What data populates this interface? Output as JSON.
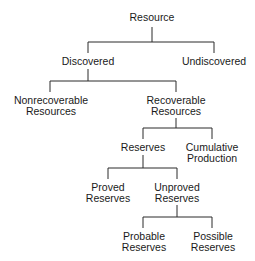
{
  "diagram": {
    "type": "tree",
    "line_color": "#2a2a2a",
    "nodes": {
      "resource": {
        "lines": [
          "Resource"
        ]
      },
      "discovered": {
        "lines": [
          "Discovered"
        ]
      },
      "undiscovered": {
        "lines": [
          "Undiscovered"
        ]
      },
      "nonrecoverable": {
        "lines": [
          "Nonrecoverable",
          "Resources"
        ]
      },
      "recoverable": {
        "lines": [
          "Recoverable",
          "Resources"
        ]
      },
      "reserves": {
        "lines": [
          "Reserves"
        ]
      },
      "cumulative": {
        "lines": [
          "Cumulative",
          "Production"
        ]
      },
      "proved": {
        "lines": [
          "Proved",
          "Reserves"
        ]
      },
      "unproved": {
        "lines": [
          "Unproved",
          "Reserves"
        ]
      },
      "probable": {
        "lines": [
          "Probable",
          "Reserves"
        ]
      },
      "possible": {
        "lines": [
          "Possible",
          "Reserves"
        ]
      }
    },
    "edges": [
      [
        "Resource",
        "Discovered"
      ],
      [
        "Resource",
        "Undiscovered"
      ],
      [
        "Discovered",
        "Nonrecoverable Resources"
      ],
      [
        "Discovered",
        "Recoverable Resources"
      ],
      [
        "Recoverable Resources",
        "Reserves"
      ],
      [
        "Recoverable Resources",
        "Cumulative Production"
      ],
      [
        "Reserves",
        "Proved Reserves"
      ],
      [
        "Reserves",
        "Unproved Reserves"
      ],
      [
        "Unproved Reserves",
        "Probable Reserves"
      ],
      [
        "Unproved Reserves",
        "Possible Reserves"
      ]
    ]
  }
}
